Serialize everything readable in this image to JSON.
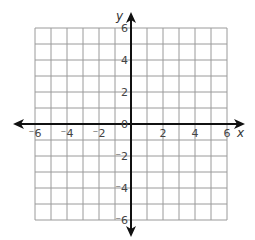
{
  "chart_data": {
    "type": "coordinate-grid",
    "title": "",
    "xlabel": "x",
    "ylabel": "y",
    "xlim": [
      -6,
      6
    ],
    "ylim": [
      -6,
      6
    ],
    "grid": true,
    "grid_step": 1,
    "x_tick_labels": [
      "⁻6",
      "⁻4",
      "⁻2",
      "2",
      "4",
      "6"
    ],
    "x_tick_values": [
      -6,
      -4,
      -2,
      2,
      4,
      6
    ],
    "y_tick_labels": [
      "6",
      "4",
      "2",
      "⁻2",
      "⁻4",
      "⁻6"
    ],
    "y_tick_values": [
      6,
      4,
      2,
      -2,
      -4,
      -6
    ],
    "origin_label": "0",
    "series": []
  },
  "colors": {
    "grid": "#9a9a9a",
    "axis": "#111111",
    "label": "#444444"
  }
}
